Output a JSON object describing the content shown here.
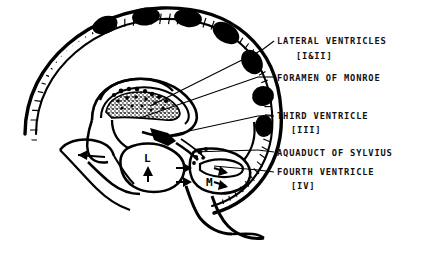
{
  "figure": {
    "background_color": "#ffffff",
    "ink_color": "#000000"
  },
  "labels": [
    {
      "id": "lateral-ventricles",
      "line1": "LATERAL VENTRICLES",
      "line2": "[I&II]"
    },
    {
      "id": "foramen-of-monroe",
      "line1": "FORAMEN OF MONROE",
      "line2": ""
    },
    {
      "id": "third-ventricle",
      "line1": "THIRD VENTRICLE",
      "line2": "[III]"
    },
    {
      "id": "aquaduct-of-sylvius",
      "line1": "AQUADUCT OF SYLVIUS",
      "line2": ""
    },
    {
      "id": "fourth-ventricle",
      "line1": "FOURTH VENTRICLE",
      "line2": "[IV]"
    }
  ],
  "diagram_markers": [
    {
      "id": "marker-l",
      "text": "L"
    },
    {
      "id": "marker-m",
      "text": "M"
    }
  ]
}
